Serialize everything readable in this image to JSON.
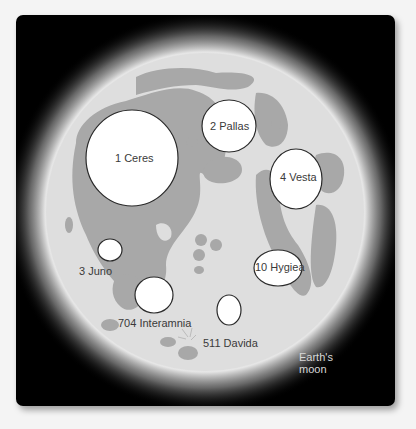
{
  "diagram": {
    "moon_label": [
      "Earth's",
      "moon"
    ],
    "colors": {
      "background": "#000000",
      "moon_highlands": "#dedede",
      "moon_maria": "#a8a8a8",
      "asteroid_fill": "#ffffff",
      "asteroid_outline": "#2a2a2a",
      "label_text": "#3a3a3a"
    },
    "asteroids": [
      {
        "name": "1 Ceres"
      },
      {
        "name": "2 Pallas"
      },
      {
        "name": "4 Vesta"
      },
      {
        "name": "3 Juno"
      },
      {
        "name": "10 Hygiea"
      },
      {
        "name": "704 Interamnia"
      },
      {
        "name": "511 Davida"
      }
    ]
  }
}
